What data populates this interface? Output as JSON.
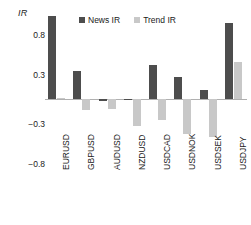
{
  "chart_data": {
    "type": "bar",
    "title": "",
    "ylabel": "IR",
    "xlabel": "",
    "categories": [
      "EURUSD",
      "GBPUSD",
      "AUDUSD",
      "NZDUSD",
      "USDCAD",
      "USDNOK",
      "USDSEK",
      "USDJPY"
    ],
    "series": [
      {
        "name": "News IR",
        "color": "#4d4d4d",
        "values": [
          1.03,
          0.35,
          -0.02,
          0.01,
          0.42,
          0.27,
          0.12,
          0.94
        ]
      },
      {
        "name": "Trend IR",
        "color": "#c8c8c8",
        "values": [
          0.02,
          -0.13,
          -0.12,
          -0.33,
          -0.25,
          -0.43,
          -0.46,
          0.46
        ]
      }
    ],
    "yticks": [
      0.8,
      0.3,
      -0.3,
      -0.8
    ],
    "ytick_labels": [
      "0.8",
      "0.3",
      "−0.3",
      "−0.8"
    ],
    "ylim": [
      -0.8,
      1.08
    ],
    "grid": false,
    "legend_position": "top-center"
  },
  "legend": {
    "items": [
      {
        "label": "News IR",
        "color": "#4d4d4d"
      },
      {
        "label": "Trend IR",
        "color": "#c8c8c8"
      }
    ]
  },
  "axis": {
    "y_title": "IR"
  }
}
